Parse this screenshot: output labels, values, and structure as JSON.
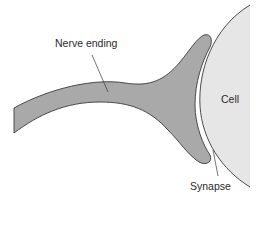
{
  "diagram": {
    "labels": {
      "nerve_ending": "Nerve ending",
      "cell": "Cell",
      "synapse": "Synapse"
    },
    "colors": {
      "nerve_fill": "#a9a9a9",
      "cell_fill": "#e6e6e6",
      "outline": "#3a3a3a",
      "background": "#ffffff"
    }
  }
}
